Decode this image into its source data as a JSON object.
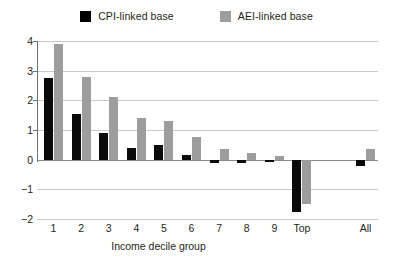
{
  "chart_data": {
    "type": "bar",
    "title": "",
    "xlabel": "Income decile group",
    "ylabel": "",
    "categories": [
      "1",
      "2",
      "3",
      "4",
      "5",
      "6",
      "7",
      "8",
      "9",
      "Top",
      "All"
    ],
    "ylim": [
      -2,
      4
    ],
    "yticks": [
      "4",
      "3",
      "2",
      "1",
      "0",
      "−1",
      "−2"
    ],
    "grid": true,
    "legend_position": "top-center",
    "series": [
      {
        "name": "CPI-linked base",
        "color": "#000000",
        "values": [
          2.75,
          1.55,
          0.9,
          0.4,
          0.5,
          0.15,
          -0.1,
          -0.1,
          -0.08,
          -1.75,
          -0.2
        ]
      },
      {
        "name": "AEI-linked base",
        "color": "#9d9d9d",
        "values": [
          3.9,
          2.8,
          2.1,
          1.4,
          1.3,
          0.75,
          0.35,
          0.22,
          0.12,
          -1.5,
          0.35
        ]
      }
    ]
  },
  "legend": {
    "items": [
      {
        "label": "CPI-linked base",
        "swatch": "black-square-icon"
      },
      {
        "label": "AEI-linked base",
        "swatch": "gray-square-icon"
      }
    ]
  },
  "axes": {
    "x_title": "Income decile group"
  }
}
